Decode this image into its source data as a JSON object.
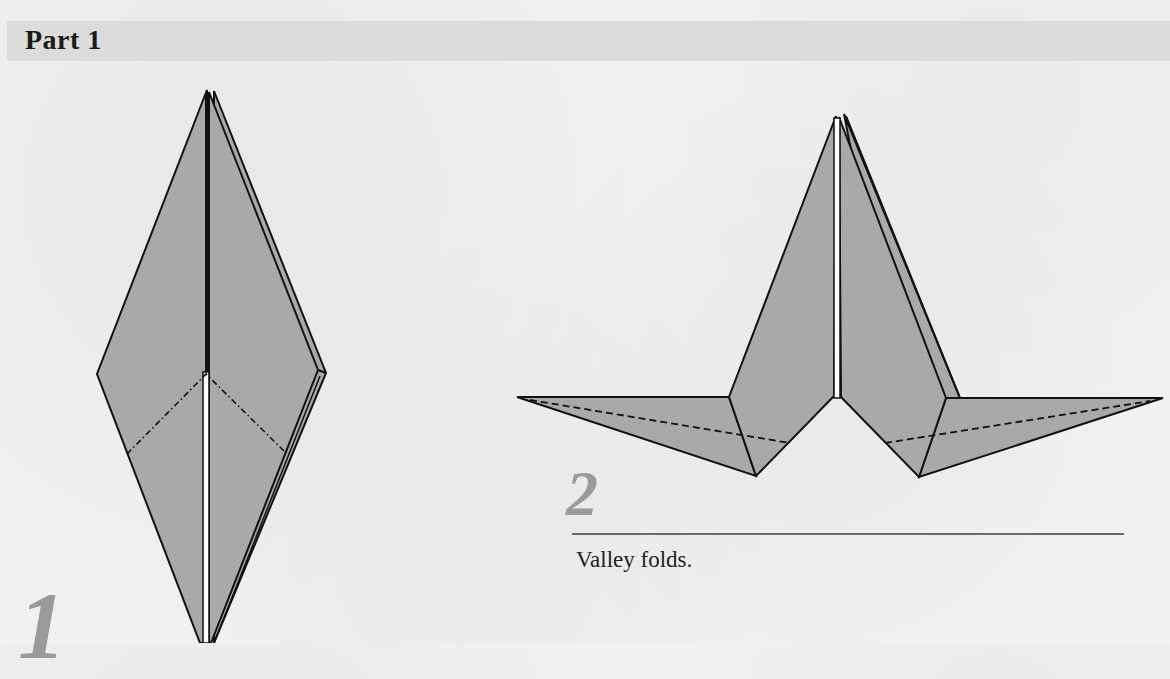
{
  "header": {
    "title": "Part 1"
  },
  "steps": [
    {
      "number": "1",
      "instruction": ""
    },
    {
      "number": "2",
      "instruction": "Valley folds."
    }
  ],
  "colors": {
    "paper_fill": "#a9a9a9",
    "line": "#111111",
    "step_number": "#9a9a9a",
    "header_band": "#dcdcdc",
    "background": "#f1f1f1"
  }
}
